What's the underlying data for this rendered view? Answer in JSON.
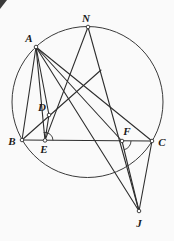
{
  "figure": {
    "name": "circle-geometry-diagram",
    "width": 174,
    "height": 241,
    "colors": {
      "background": "#fafafa",
      "stroke": "#2e2e2e",
      "circle_stroke": "#3a3a3a",
      "label": "#1a1a1a",
      "marker_fill": "#ffffff"
    },
    "circle": {
      "cx": 87.5,
      "cy": 102,
      "r": 75.5
    },
    "points": [
      {
        "id": "N",
        "x": 88,
        "y": 27,
        "label": "N",
        "lx": 86,
        "ly": 22
      },
      {
        "id": "A",
        "x": 36,
        "y": 47,
        "label": "A",
        "lx": 29,
        "ly": 42
      },
      {
        "id": "B",
        "x": 22,
        "y": 140,
        "label": "B",
        "lx": 12,
        "ly": 145
      },
      {
        "id": "C",
        "x": 152,
        "y": 141,
        "label": "C",
        "lx": 162,
        "ly": 146
      },
      {
        "id": "E",
        "x": 45,
        "y": 140.4,
        "label": "E",
        "lx": 44,
        "ly": 153
      },
      {
        "id": "D",
        "x": 49,
        "y": 115,
        "label": "D",
        "lx": 42,
        "ly": 111
      },
      {
        "id": "F",
        "x": 122,
        "y": 141,
        "label": "F",
        "lx": 127,
        "ly": 135
      },
      {
        "id": "J",
        "x": 139,
        "y": 211,
        "label": "J",
        "lx": 139,
        "ly": 227
      }
    ],
    "segments": [
      {
        "name": "segment-B-C",
        "from": "B",
        "to": "C"
      },
      {
        "name": "segment-A-B",
        "from": "A",
        "to": "B"
      },
      {
        "name": "segment-A-E",
        "from": "A",
        "to": "E"
      },
      {
        "name": "segment-A-D",
        "from": "A",
        "to": "D"
      },
      {
        "name": "segment-D-E",
        "from": "D",
        "to": "E"
      },
      {
        "name": "segment-A-F",
        "from": "A",
        "to": "F"
      },
      {
        "name": "segment-A-C",
        "from": "A",
        "to": "C"
      },
      {
        "name": "segment-A-J",
        "from": "A",
        "to": "J"
      },
      {
        "name": "segment-N-E",
        "from": "N",
        "to": "E"
      },
      {
        "name": "segment-N-J",
        "from": "N",
        "to": "J"
      },
      {
        "name": "segment-F-J",
        "from": "F",
        "to": "J"
      },
      {
        "name": "segment-C-J",
        "from": "C",
        "to": "J"
      }
    ],
    "extra_segments": [
      {
        "name": "ray-B-through-D",
        "x1": 22,
        "y1": 140,
        "x2": 101,
        "y2": 70
      }
    ],
    "angle_marks": [
      {
        "name": "angle-mark-E",
        "cx": 45,
        "cy": 140.4,
        "r": 8,
        "from_deg": 0,
        "to_deg": 100
      },
      {
        "name": "angle-mark-F",
        "cx": 122,
        "cy": 141,
        "r": 9,
        "from_deg": 0,
        "to_deg": -76
      }
    ],
    "marker_radius": 1.8,
    "corner_artifact": {
      "points": "0,0 7,0 0,9"
    }
  }
}
